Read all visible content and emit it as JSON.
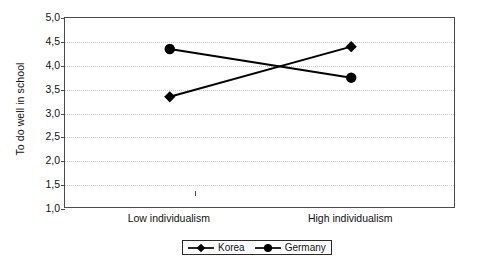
{
  "chart_data": {
    "type": "line",
    "title": "",
    "xlabel": "",
    "ylabel": "To do well in school",
    "categories": [
      "Low individualism",
      "High individualism"
    ],
    "series": [
      {
        "name": "Korea",
        "marker": "diamond",
        "values": [
          3.35,
          4.4
        ]
      },
      {
        "name": "Germany",
        "marker": "circle",
        "values": [
          4.35,
          3.75
        ]
      }
    ],
    "ylim": [
      1.0,
      5.0
    ],
    "ytick_step": 0.5,
    "ytick_labels": [
      "5,0",
      "4,5",
      "4,0",
      "3,5",
      "3,0",
      "2,5",
      "2,0",
      "1,5",
      "1,0"
    ],
    "ytick_values": [
      5.0,
      4.5,
      4.0,
      3.5,
      3.0,
      2.5,
      2.0,
      1.5,
      1.0
    ],
    "decimal_separator": ",",
    "grid": true,
    "grid_axis": "y",
    "legend_position": "bottom-center",
    "line_color": "#000000",
    "grid_color": "#c9c9c9",
    "frame_color": "#4a4a4a"
  }
}
